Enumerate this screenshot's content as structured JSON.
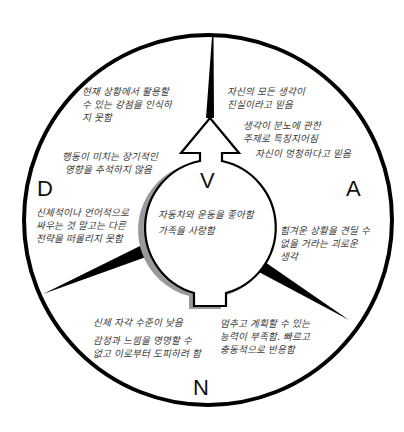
{
  "diagram": {
    "type": "circular-quadrant-diagram",
    "quadrants": {
      "V": {
        "label": "V",
        "center_text": [
          "자동차와 운동을 좋아함",
          "가족을 사랑함"
        ]
      },
      "A": {
        "label": "A",
        "texts": [
          [
            "자신의 모든 생각이",
            "진실이라고 믿음"
          ],
          [
            "생각이 분노에 관한",
            "주제로 특징지어짐"
          ],
          [
            "자신이 멍청하다고 믿음"
          ],
          [
            "힘겨운 상황을 견딜 수",
            "없을 거라는 괴로운",
            "생각"
          ]
        ]
      },
      "D": {
        "label": "D",
        "texts": [
          [
            "현재 상황에서 활용할",
            "수 있는 강점을 인식하",
            "지 못함"
          ],
          [
            "행동이 미치는 장기적인",
            "영향을 추적하지 않음"
          ],
          [
            "신체적이나 언어적으로",
            "싸우는 것 말고는 다른",
            "전략을 떠올리지 못함"
          ]
        ]
      },
      "N": {
        "label": "N",
        "texts": [
          [
            "신체 자각 수준이 낮음"
          ],
          [
            "감정과 느낌을 명명할 수",
            "없고 이로부터 도피하려 함"
          ],
          [
            "멈추고 계획할 수 있는",
            "능력이 부족함. 빠르고",
            "충동적으로 반응함"
          ]
        ]
      }
    },
    "colors": {
      "stroke": "#000000",
      "shadow": "#9a9a9a",
      "text": "#3a3a3a",
      "background": "#ffffff"
    }
  }
}
